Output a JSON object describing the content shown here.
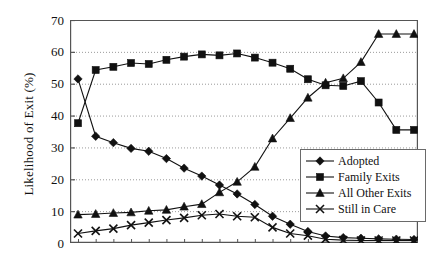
{
  "chart_data": {
    "type": "line",
    "title": "",
    "xlabel": "",
    "ylabel": "Likelihood of Exit (%)",
    "ylim": [
      0,
      70
    ],
    "ytick_values": [
      0,
      10,
      20,
      30,
      40,
      50,
      60,
      70
    ],
    "ytick_labels": [
      "0",
      "10",
      "20",
      "30",
      "40",
      "50",
      "60",
      "70"
    ],
    "xlim": [
      0,
      19
    ],
    "x": [
      0,
      1,
      2,
      3,
      4,
      5,
      6,
      7,
      8,
      9,
      10,
      11,
      12,
      13,
      14,
      15,
      16,
      17,
      18,
      19
    ],
    "xtick_labels": [],
    "grid": true,
    "legend_position": "lower-right",
    "series": [
      {
        "name": "Adopted",
        "marker": "diamond",
        "values": [
          51.5,
          33.5,
          31.5,
          29.7,
          28.8,
          26.5,
          23.5,
          21.0,
          18.2,
          15.4,
          12.1,
          8.4,
          5.9,
          3.6,
          2.2,
          1.7,
          1.5,
          1.3,
          1.2,
          1.1
        ]
      },
      {
        "name": "Family Exits",
        "marker": "square",
        "values": [
          37.6,
          54.3,
          55.3,
          56.5,
          56.2,
          57.5,
          58.5,
          59.2,
          58.9,
          59.5,
          58.2,
          56.6,
          54.7,
          51.4,
          49.5,
          49.3,
          50.8,
          44.1,
          35.5,
          35.5
        ]
      },
      {
        "name": "All Other Exits",
        "marker": "triangle",
        "values": [
          8.9,
          9.1,
          9.4,
          9.6,
          10.1,
          10.4,
          11.4,
          12.2,
          15.9,
          19.2,
          23.9,
          32.8,
          39.2,
          45.6,
          50.3,
          51.7,
          56.8,
          65.6,
          65.6,
          65.6
        ]
      },
      {
        "name": "Still in Care",
        "marker": "x",
        "values": [
          3.0,
          3.8,
          4.5,
          5.6,
          6.4,
          7.2,
          7.9,
          8.7,
          9.1,
          8.4,
          8.1,
          4.9,
          3.0,
          2.3,
          1.2,
          0.9,
          0.8,
          0.8,
          0.8,
          0.8
        ]
      }
    ]
  },
  "axis": {
    "y_label": "Likelihood of Exit (%)"
  },
  "legend": {
    "entries": [
      {
        "label": "Adopted",
        "marker": "diamond"
      },
      {
        "label": "Family Exits",
        "marker": "square"
      },
      {
        "label": "All Other Exits",
        "marker": "triangle"
      },
      {
        "label": "Still in Care",
        "marker": "x"
      }
    ]
  },
  "style": {
    "line_color": "#111111",
    "grid_color": "#9a9a9a",
    "axis_color": "#555555",
    "background": "#ffffff"
  }
}
